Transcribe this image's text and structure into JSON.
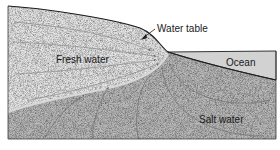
{
  "diagram": {
    "labels": {
      "fresh_water": "Fresh water",
      "water_table": "Water table",
      "ocean": "Ocean",
      "salt_water": "Salt water"
    },
    "colors": {
      "fresh_zone": "#e4e4e4",
      "salt_zone": "#b9b9b9",
      "ocean": "#d2d2d2",
      "outline": "#1e1e1e",
      "flow_lines": "#6e6e6e"
    }
  }
}
